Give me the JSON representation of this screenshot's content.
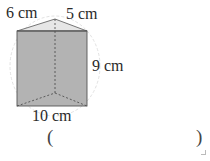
{
  "figure": {
    "type": "triangular-prism",
    "labels": {
      "top_left_edge": "6 cm",
      "top_right_edge": "5 cm",
      "height": "9 cm",
      "base_edge": "10 cm"
    },
    "colors": {
      "face_fill": "#b3b3b3",
      "top_fill": "#e6e6e6",
      "edge": "#555555",
      "circle": "#e2e2e2"
    }
  },
  "answer": {
    "open_paren": "(",
    "close_paren": ")",
    "value": ""
  }
}
